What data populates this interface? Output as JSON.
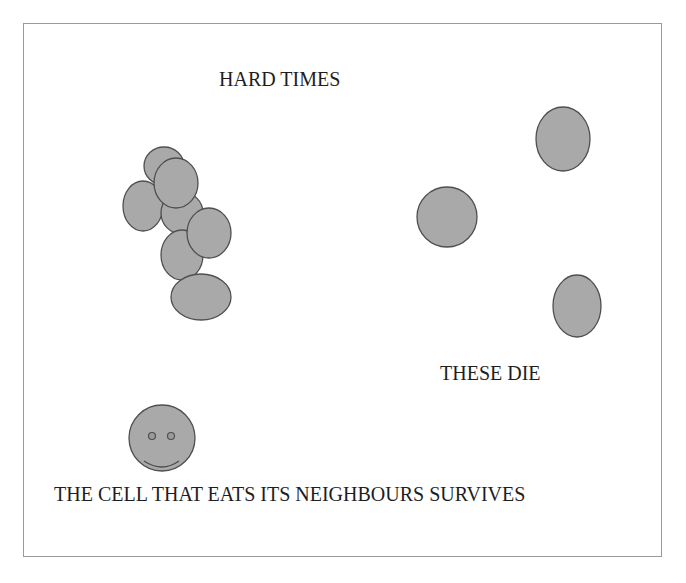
{
  "diagram": {
    "labels": {
      "hard_times": "HARD TIMES",
      "these_die": "THESE DIE",
      "survivor_caption": "THE CELL THAT EATS ITS NEIGHBOURS SURVIVES"
    },
    "colors": {
      "cell_fill": "#a9a9a9",
      "cell_stroke": "#4f4f4f",
      "frame_border": "#9a9a9a",
      "text": "#1e1e1e"
    },
    "cluster_cells": [
      {
        "cx": 164,
        "cy": 166,
        "rx": 20,
        "ry": 19
      },
      {
        "cx": 143,
        "cy": 206,
        "rx": 20,
        "ry": 25
      },
      {
        "cx": 182,
        "cy": 213,
        "rx": 21,
        "ry": 21
      },
      {
        "cx": 176,
        "cy": 183,
        "rx": 22,
        "ry": 25
      },
      {
        "cx": 182,
        "cy": 255,
        "rx": 21,
        "ry": 25
      },
      {
        "cx": 209,
        "cy": 233,
        "rx": 22,
        "ry": 25
      },
      {
        "cx": 201,
        "cy": 297,
        "rx": 30,
        "ry": 23
      }
    ],
    "dying_cells": [
      {
        "cx": 563,
        "cy": 139,
        "rx": 27,
        "ry": 32
      },
      {
        "cx": 447,
        "cy": 217,
        "rx": 30,
        "ry": 30
      },
      {
        "cx": 577,
        "cy": 306,
        "rx": 24,
        "ry": 31
      }
    ],
    "survivor": {
      "cx": 162,
      "cy": 438,
      "r": 33,
      "icon": "smiley-face-icon"
    }
  }
}
